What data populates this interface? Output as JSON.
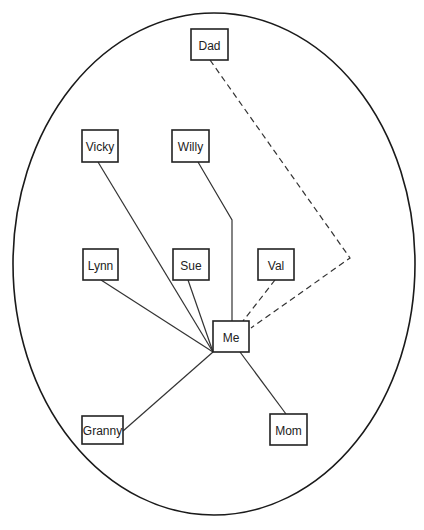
{
  "diagram": {
    "type": "ego-network",
    "boundary": {
      "shape": "ellipse",
      "cx": 214,
      "cy": 264,
      "rx": 201,
      "ry": 251
    },
    "nodes": [
      {
        "id": "dad",
        "label": "Dad",
        "x": 191,
        "y": 29,
        "w": 37,
        "h": 31
      },
      {
        "id": "vicky",
        "label": "Vicky",
        "x": 82,
        "y": 130,
        "w": 36,
        "h": 32
      },
      {
        "id": "willy",
        "label": "Willy",
        "x": 172,
        "y": 130,
        "w": 37,
        "h": 32
      },
      {
        "id": "lynn",
        "label": "Lynn",
        "x": 83,
        "y": 249,
        "w": 35,
        "h": 31
      },
      {
        "id": "sue",
        "label": "Sue",
        "x": 173,
        "y": 249,
        "w": 36,
        "h": 31
      },
      {
        "id": "val",
        "label": "Val",
        "x": 258,
        "y": 249,
        "w": 36,
        "h": 31
      },
      {
        "id": "me",
        "label": "Me",
        "x": 213,
        "y": 321,
        "w": 36,
        "h": 31
      },
      {
        "id": "granny",
        "label": "Granny",
        "x": 82,
        "y": 416,
        "w": 41,
        "h": 28
      },
      {
        "id": "mom",
        "label": "Mom",
        "x": 270,
        "y": 414,
        "w": 37,
        "h": 31
      }
    ],
    "edges": [
      {
        "from": "vicky",
        "to": "me",
        "style": "solid",
        "points": "98,162 213,352"
      },
      {
        "from": "willy",
        "to": "me",
        "style": "solid",
        "points": "198,162 232,220 232,321"
      },
      {
        "from": "lynn",
        "to": "me",
        "style": "solid",
        "points": "101,280 213,352"
      },
      {
        "from": "sue",
        "to": "me",
        "style": "solid",
        "points": "188,280 213,352"
      },
      {
        "from": "granny",
        "to": "me",
        "style": "solid",
        "points": "123,431 213,352"
      },
      {
        "from": "me",
        "to": "mom",
        "style": "solid",
        "points": "240,352 286,414"
      },
      {
        "from": "val",
        "to": "me",
        "style": "dashed",
        "points": "275,280 243,321"
      },
      {
        "from": "dad",
        "to": "me",
        "style": "dashed",
        "points": "210,60 350,258 251,328"
      }
    ]
  }
}
